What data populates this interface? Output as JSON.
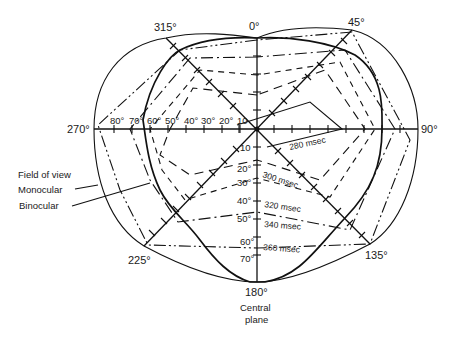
{
  "diagram": {
    "type": "polar visual field plot with reaction-time isochrones",
    "directions": {
      "d0": "0°",
      "d45": "45°",
      "d90": "90°",
      "d135": "135°",
      "d180": "180°",
      "d225": "225°",
      "d270": "270°",
      "d315": "315°"
    },
    "horizontal_scale": [
      "80°",
      "70°",
      "60°",
      "50°",
      "40°",
      "30°",
      "20°",
      "10"
    ],
    "vertical_scale": [
      "10",
      "20°",
      "30°",
      "40°",
      "50°",
      "60°",
      "70°"
    ],
    "isochrones": {
      "t280": "280 msec",
      "t300": "300 msec",
      "t320": "320 msec",
      "t340": "340 msec",
      "t360": "360 msec"
    },
    "legend": {
      "title": "Field of view",
      "monocular": "Monocular",
      "binocular": "Binocular"
    },
    "central_plane": {
      "line1": "Central",
      "line2": "plane"
    },
    "colors": {
      "ink": "#111111",
      "background": "#ffffff"
    }
  }
}
